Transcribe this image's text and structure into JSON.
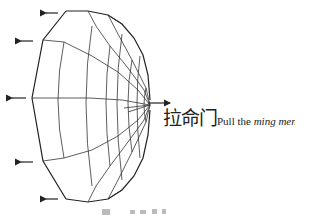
{
  "diagram": {
    "label": {
      "chinese": "拉命门",
      "english_prefix": "Pull the ",
      "english_italic": "ming men"
    },
    "arrows": {
      "outward_left_count": 5,
      "rightward_count": 1
    },
    "caption": ""
  }
}
